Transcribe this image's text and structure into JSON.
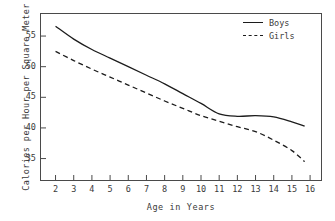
{
  "chart_data": {
    "type": "line",
    "title": "",
    "xlabel": "Age in Years",
    "ylabel": "Calories per Hour per Square Meter",
    "xlim": [
      1.2,
      16.6
    ],
    "ylim": [
      31.5,
      58.6
    ],
    "xticks": [
      2,
      3,
      4,
      5,
      6,
      7,
      8,
      9,
      10,
      11,
      12,
      13,
      14,
      15,
      16
    ],
    "yticks": [
      35,
      40,
      45,
      50,
      55
    ],
    "grid": false,
    "legend_position": "top-right",
    "x": [
      2,
      3,
      4,
      5,
      6,
      7,
      8,
      9,
      10,
      11,
      12,
      13,
      14,
      15,
      15.7
    ],
    "series": [
      {
        "name": "Boys",
        "style": "solid",
        "color": "#1c1c1c",
        "values": [
          56.6,
          54.5,
          52.8,
          51.4,
          50.0,
          48.6,
          47.2,
          45.6,
          44.0,
          42.3,
          41.9,
          42.0,
          41.8,
          41.0,
          40.3
        ]
      },
      {
        "name": "Girls",
        "style": "dashed",
        "color": "#1c1c1c",
        "values": [
          52.5,
          51.0,
          49.6,
          48.3,
          47.0,
          45.7,
          44.4,
          43.2,
          42.0,
          41.1,
          40.2,
          39.4,
          38.0,
          36.3,
          34.5
        ]
      }
    ]
  },
  "legend": {
    "items": [
      {
        "label": "Boys",
        "style": "solid"
      },
      {
        "label": "Girls",
        "style": "dashed"
      }
    ]
  }
}
